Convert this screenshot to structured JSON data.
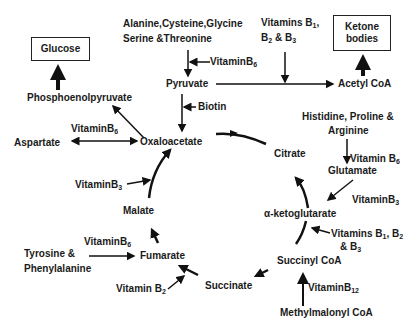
{
  "boxes": {
    "glucose": "Glucose",
    "ketone_line1": "Ketone",
    "ketone_line2": "bodies"
  },
  "metabolites": {
    "phosphoenolpyruvate": "Phosphoenolpyruvate",
    "pyruvate": "Pyruvate",
    "acetyl_coa": "Acetyl CoA",
    "oxaloacetate": "Oxaloacetate",
    "aspartate": "Aspartate",
    "citrate": "Citrate",
    "glutamate": "Glutamate",
    "alpha_ketoglutarate": "α-ketoglutarate",
    "malate": "Malate",
    "fumarate": "Fumarate",
    "succinate": "Succinate",
    "succinyl_coa": "Succinyl CoA",
    "methylmalonyl_coa": "Methylmalonyl CoA"
  },
  "precursors": {
    "amino_line1": "Alanine,Cysteine,Glycine",
    "amino_line2": "Serine &Threonine",
    "his_line1": "Histidine, Proline &",
    "his_line2": "Arginine",
    "tyr_line1": "Tyrosine &",
    "tyr_line2": "Phenylalanine"
  },
  "cofactors": {
    "vit_b6_pyruvate": "VitaminB",
    "vit_b6_pyruvate_sub": "6",
    "vit_b123_top_line1": "Vitamins B",
    "vit_b123_top_line1_sub": "1",
    "vit_b123_top_line1_end": ",",
    "vit_b123_top_line2a": "B",
    "vit_b123_top_line2a_sub": "2",
    "vit_b123_top_line2b": " & B",
    "vit_b123_top_line2b_sub": "3",
    "biotin": "Biotin",
    "vit_b6_aspartate": "VitaminB",
    "vit_b6_aspartate_sub": "6",
    "vit_b6_glutamate": "Vitamin B",
    "vit_b6_glutamate_sub": "6",
    "vit_b3_malate": "VitaminB",
    "vit_b3_malate_sub": "3",
    "vit_b3_akg": "VitaminB",
    "vit_b3_akg_sub": "3",
    "vit_b123_akg_line1a": "Vitamins B",
    "vit_b123_akg_line1a_sub": "1",
    "vit_b123_akg_line1b": ", B",
    "vit_b123_akg_line1b_sub": "2",
    "vit_b123_akg_line2": "& B",
    "vit_b123_akg_line2_sub": "3",
    "vit_b6_fumarate": "VitaminB",
    "vit_b6_fumarate_sub": "6",
    "vit_b2_succinate": "Vitamin B",
    "vit_b2_succinate_sub": "2",
    "vit_b12": "VitaminB",
    "vit_b12_sub": "12"
  }
}
